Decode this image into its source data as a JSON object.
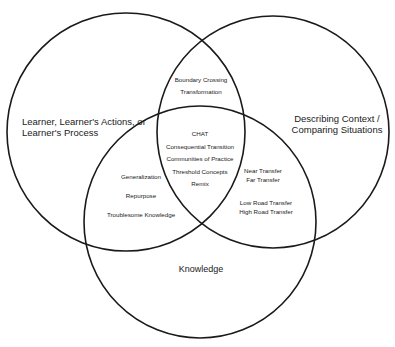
{
  "diagram": {
    "type": "venn",
    "circles": [
      {
        "id": "learner",
        "label_lines": [
          "Learner, Learner's Actions, or",
          "Learner's Process"
        ],
        "cx": 126,
        "cy": 132,
        "r": 119
      },
      {
        "id": "context",
        "label_lines": [
          "Describing Context /",
          "Comparing Situations"
        ],
        "cx": 273,
        "cy": 132,
        "r": 116
      },
      {
        "id": "knowledge",
        "label_lines": [
          "Knowledge"
        ],
        "cx": 200,
        "cy": 222,
        "r": 116
      }
    ],
    "stroke_color": "#1a1a1a",
    "regions": {
      "learner_context": [
        "Boundary Crossing",
        "Transformation"
      ],
      "center": [
        "CHAT",
        "Consequential Transition",
        "Communities of Practice",
        "Threshold Concepts",
        "Remix"
      ],
      "learner_knowledge": [
        "Generalization",
        "Repurpose",
        "Troublesome Knowledge"
      ],
      "context_knowledge_1": [
        "Near Transfer",
        "Far Transfer"
      ],
      "context_knowledge_2": [
        "Low Road Transfer",
        "High Road Transfer"
      ]
    }
  }
}
